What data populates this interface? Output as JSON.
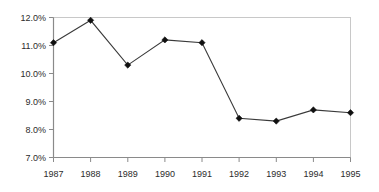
{
  "chart_data": {
    "type": "line",
    "title": "",
    "subtitle": "",
    "xlabel": "",
    "ylabel": "",
    "categories": [
      "1987",
      "1988",
      "1989",
      "1990",
      "1991",
      "1992",
      "1993",
      "1994",
      "1995"
    ],
    "x": [
      1987,
      1988,
      1989,
      1990,
      1991,
      1992,
      1993,
      1994,
      1995
    ],
    "values": [
      11.1,
      11.9,
      10.3,
      11.2,
      11.1,
      8.4,
      8.3,
      8.7,
      8.6
    ],
    "series": [
      {
        "name": "",
        "values": [
          11.1,
          11.9,
          10.3,
          11.2,
          11.1,
          8.4,
          8.3,
          8.7,
          8.6
        ]
      }
    ],
    "point_labels": [
      "11.1%",
      "11.9%",
      "10.3%",
      "11.2%",
      "11.1%",
      "8.4%",
      "8.3%",
      "8.7%",
      "8.6%"
    ],
    "ylim": [
      7.0,
      12.0
    ],
    "ytick_values": [
      7.0,
      8.0,
      9.0,
      10.0,
      11.0,
      12.0
    ],
    "ytick_labels": [
      "7.0%",
      "8.0%",
      "9.0%",
      "10.0%",
      "11.0%",
      "12.0%"
    ],
    "xtick_labels": [
      "1987",
      "1988",
      "1989",
      "1990",
      "1991",
      "1992",
      "1993",
      "1994",
      "1995"
    ],
    "grid": false,
    "legend": null,
    "legend_position": "none",
    "marker": "diamond",
    "colors": {
      "line": "#3a3a3a",
      "marker": "#101010",
      "axis": "#8a8a8a",
      "plot_border": "#c8c8c8",
      "text": "#2b2b2b",
      "background": "#ffffff"
    },
    "annotations": []
  }
}
